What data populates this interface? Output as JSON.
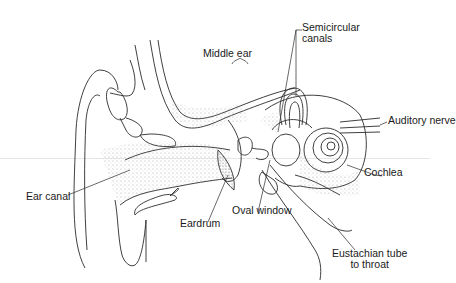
{
  "diagram": {
    "colors": {
      "line": "#2a2a2a",
      "stipple": "#9a9a9a",
      "background": "#ffffff"
    },
    "labels": {
      "semicircular_canals_1": "Semicircular",
      "semicircular_canals_2": "canals",
      "middle_ear": "Middle ear",
      "auditory_nerve": "Auditory nerve",
      "cochlea": "Cochlea",
      "ear_canal": "Ear canal",
      "eardrum": "Eardrum",
      "oval_window": "Oval window",
      "eustachian_1": "Eustachian tube",
      "eustachian_2": "to throat"
    }
  }
}
